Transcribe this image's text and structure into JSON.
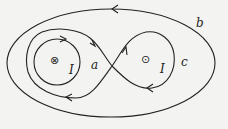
{
  "diagram": {
    "type": "ampere-loop-diagram",
    "background": "#f3f3f1",
    "stroke_color": "#222222",
    "currents": [
      {
        "id": "left-current",
        "symbol": "⊗",
        "direction": "into-page",
        "label": "I"
      },
      {
        "id": "right-current",
        "symbol": "⊙",
        "direction": "out-of-page",
        "label": "I"
      }
    ],
    "loops": [
      {
        "id": "a",
        "label": "a",
        "shape": "circle-around-left-current"
      },
      {
        "id": "b",
        "label": "b",
        "shape": "ellipse-around-both-currents"
      },
      {
        "id": "c",
        "label": "c",
        "shape": "figure-eight"
      }
    ]
  }
}
